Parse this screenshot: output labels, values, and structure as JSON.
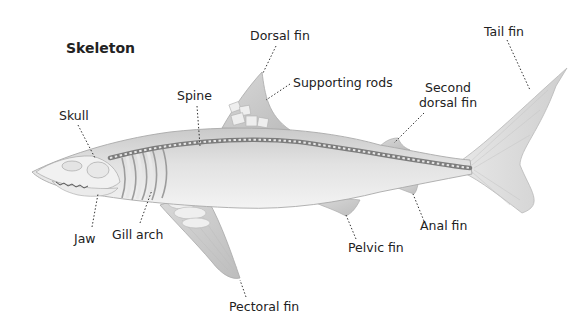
{
  "diagram": {
    "title": "Skeleton",
    "labels": [
      {
        "id": "dorsal-fin",
        "text": "Dorsal fin"
      },
      {
        "id": "supporting-rods",
        "text": "Supporting rods"
      },
      {
        "id": "tail-fin",
        "text": "Tail fin"
      },
      {
        "id": "second-dorsal-fin",
        "line1": "Second",
        "line2": "dorsal fin"
      },
      {
        "id": "spine",
        "text": "Spine"
      },
      {
        "id": "skull",
        "text": "Skull"
      },
      {
        "id": "jaw",
        "text": "Jaw"
      },
      {
        "id": "gill-arch",
        "text": "Gill arch"
      },
      {
        "id": "pectoral-fin",
        "text": "Pectoral fin"
      },
      {
        "id": "pelvic-fin",
        "text": "Pelvic fin"
      },
      {
        "id": "anal-fin",
        "text": "Anal fin"
      }
    ],
    "colors": {
      "background": "#ffffff",
      "body": "#d9d9d9",
      "bone": "#efefef",
      "spine": "#8a8a8a",
      "leader": "#333333",
      "text": "#222222"
    }
  }
}
